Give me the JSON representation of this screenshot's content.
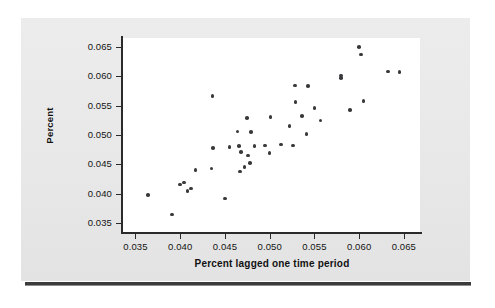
{
  "figure": {
    "background_color": "#ffffff",
    "panel_color": "#e9e9e9",
    "rule_color": "#3b3b3b"
  },
  "chart_data": {
    "type": "scatter",
    "title": "",
    "xlabel": "Percent lagged one time period",
    "ylabel": "Percent",
    "xlim": [
      0.0335,
      0.0668
    ],
    "ylim": [
      0.0335,
      0.0665
    ],
    "xticks": [
      0.035,
      0.04,
      0.045,
      0.05,
      0.055,
      0.06,
      0.065
    ],
    "yticks": [
      0.035,
      0.04,
      0.045,
      0.05,
      0.055,
      0.06,
      0.065
    ],
    "xticklabels": [
      "0.035",
      "0.040",
      "0.045",
      "0.050",
      "0.055",
      "0.060",
      "0.065"
    ],
    "yticklabels": [
      "0.035",
      "0.040",
      "0.045",
      "0.050",
      "0.055",
      "0.060",
      "0.065"
    ],
    "grid": false,
    "legend": null,
    "marker": {
      "shape": "circle",
      "color": "#39393b",
      "size": 3.6
    },
    "n_points": 43,
    "points": [
      {
        "x": 0.0364,
        "y": 0.0398
      },
      {
        "x": 0.0391,
        "y": 0.0365
      },
      {
        "x": 0.04,
        "y": 0.0416
      },
      {
        "x": 0.0404,
        "y": 0.0419
      },
      {
        "x": 0.0408,
        "y": 0.0405
      },
      {
        "x": 0.0412,
        "y": 0.0409
      },
      {
        "x": 0.0417,
        "y": 0.044
      },
      {
        "x": 0.0435,
        "y": 0.0443
      },
      {
        "x": 0.0436,
        "y": 0.0566
      },
      {
        "x": 0.0437,
        "y": 0.0478
      },
      {
        "x": 0.045,
        "y": 0.0392
      },
      {
        "x": 0.0464,
        "y": 0.0506
      },
      {
        "x": 0.0466,
        "y": 0.0481
      },
      {
        "x": 0.0467,
        "y": 0.0438
      },
      {
        "x": 0.0468,
        "y": 0.0471
      },
      {
        "x": 0.0475,
        "y": 0.0529
      },
      {
        "x": 0.0476,
        "y": 0.0465
      },
      {
        "x": 0.0478,
        "y": 0.0452
      },
      {
        "x": 0.0479,
        "y": 0.0505
      },
      {
        "x": 0.0483,
        "y": 0.0481
      },
      {
        "x": 0.05,
        "y": 0.0469
      },
      {
        "x": 0.0501,
        "y": 0.0531
      },
      {
        "x": 0.0522,
        "y": 0.0515
      },
      {
        "x": 0.0526,
        "y": 0.0482
      },
      {
        "x": 0.0528,
        "y": 0.0584
      },
      {
        "x": 0.0529,
        "y": 0.0556
      },
      {
        "x": 0.0536,
        "y": 0.0532
      },
      {
        "x": 0.0541,
        "y": 0.0502
      },
      {
        "x": 0.0543,
        "y": 0.0583
      },
      {
        "x": 0.055,
        "y": 0.0546
      },
      {
        "x": 0.0557,
        "y": 0.0525
      },
      {
        "x": 0.058,
        "y": 0.0601
      },
      {
        "x": 0.058,
        "y": 0.0597
      },
      {
        "x": 0.059,
        "y": 0.0543
      },
      {
        "x": 0.06,
        "y": 0.065
      },
      {
        "x": 0.0602,
        "y": 0.0637
      },
      {
        "x": 0.0605,
        "y": 0.0558
      },
      {
        "x": 0.0632,
        "y": 0.0608
      },
      {
        "x": 0.0645,
        "y": 0.0607
      },
      {
        "x": 0.0472,
        "y": 0.0446
      },
      {
        "x": 0.0455,
        "y": 0.048
      },
      {
        "x": 0.0513,
        "y": 0.0484
      },
      {
        "x": 0.0495,
        "y": 0.0482
      }
    ]
  }
}
